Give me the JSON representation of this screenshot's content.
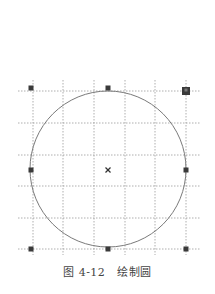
{
  "figure": {
    "caption_number": "图 4-12",
    "caption_title": "绘制圆"
  },
  "diagram": {
    "grid": {
      "color": "#9a9a9a",
      "h_lines_y": [
        91,
        123,
        155,
        186,
        218,
        249
      ],
      "v_lines_x": [
        33,
        63,
        94,
        125,
        155,
        186
      ],
      "x_range": [
        18,
        200
      ],
      "y_range": [
        80,
        255
      ]
    },
    "circle": {
      "cx": 108,
      "cy": 169,
      "r": 78,
      "stroke": "#7a7a7a"
    },
    "center_marker": {
      "x": 108,
      "y": 170,
      "symbol": "x-mark-icon",
      "color": "#333333"
    },
    "handles": [
      {
        "name": "handle-top-left",
        "x": 31,
        "y": 88,
        "size": 5
      },
      {
        "name": "handle-top-middle",
        "x": 108,
        "y": 88,
        "size": 5
      },
      {
        "name": "handle-top-right-active",
        "x": 186,
        "y": 91,
        "size": 8
      },
      {
        "name": "handle-middle-left",
        "x": 31,
        "y": 170,
        "size": 5
      },
      {
        "name": "handle-middle-right",
        "x": 186,
        "y": 170,
        "size": 5
      },
      {
        "name": "handle-bottom-left",
        "x": 31,
        "y": 249,
        "size": 5
      },
      {
        "name": "handle-bottom-middle",
        "x": 108,
        "y": 249,
        "size": 5
      },
      {
        "name": "handle-bottom-right",
        "x": 186,
        "y": 249,
        "size": 5
      }
    ],
    "handle_color": "#3a3a3a"
  }
}
